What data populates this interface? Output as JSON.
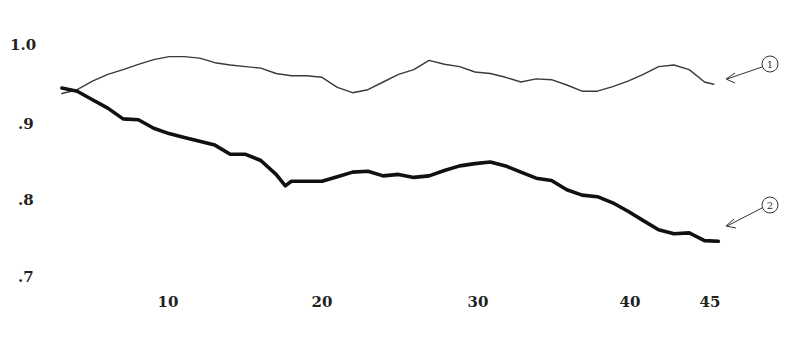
{
  "chart_data": {
    "type": "line",
    "title": "",
    "xlabel": "",
    "ylabel": "",
    "xlim": [
      0,
      50
    ],
    "ylim": [
      0.7,
      1.0
    ],
    "grid": false,
    "legend_position": "none (series identified by circled callout numbers at right)",
    "x_ticks": [
      10,
      20,
      30,
      40,
      45
    ],
    "x_tick_labels": [
      "10",
      "20",
      "30",
      "40",
      "45"
    ],
    "y_ticks": [
      1.0,
      0.9,
      0.8,
      0.7
    ],
    "y_tick_labels": [
      "1.0",
      ".9",
      ".8",
      ".7"
    ],
    "series": [
      {
        "name": "1",
        "line_weight": "thin",
        "x": [
          3,
          4,
          5,
          6,
          7,
          8,
          9,
          10,
          11,
          12,
          13,
          14,
          15,
          16,
          17,
          18,
          19,
          20,
          21,
          22,
          23,
          24,
          25,
          26,
          27,
          28,
          29,
          30,
          31,
          32,
          33,
          34,
          35,
          36,
          37,
          38,
          39,
          40,
          41,
          42,
          43,
          44,
          45,
          45.6
        ],
        "values": [
          0.937,
          0.942,
          0.953,
          0.962,
          0.968,
          0.975,
          0.981,
          0.985,
          0.985,
          0.983,
          0.977,
          0.974,
          0.972,
          0.97,
          0.963,
          0.96,
          0.96,
          0.958,
          0.945,
          0.938,
          0.942,
          0.952,
          0.962,
          0.968,
          0.98,
          0.975,
          0.972,
          0.965,
          0.963,
          0.958,
          0.952,
          0.956,
          0.955,
          0.948,
          0.94,
          0.94,
          0.946,
          0.953,
          0.962,
          0.972,
          0.974,
          0.968,
          0.952,
          0.949
        ]
      },
      {
        "name": "2",
        "line_weight": "thick",
        "x": [
          3,
          4,
          5,
          6,
          7,
          8,
          9,
          10,
          11,
          12,
          13,
          14,
          15,
          16,
          17,
          17.6,
          18,
          19,
          20,
          21,
          22,
          23,
          24,
          25,
          26,
          27,
          28,
          29,
          30,
          31,
          32,
          33,
          34,
          35,
          36,
          37,
          38,
          39,
          40,
          41,
          42,
          43,
          44,
          45,
          45.9
        ],
        "values": [
          0.944,
          0.94,
          0.929,
          0.918,
          0.904,
          0.903,
          0.892,
          0.885,
          0.88,
          0.875,
          0.87,
          0.858,
          0.858,
          0.85,
          0.832,
          0.817,
          0.823,
          0.823,
          0.823,
          0.829,
          0.835,
          0.836,
          0.83,
          0.832,
          0.828,
          0.83,
          0.837,
          0.843,
          0.846,
          0.848,
          0.843,
          0.835,
          0.827,
          0.824,
          0.812,
          0.805,
          0.803,
          0.795,
          0.784,
          0.772,
          0.76,
          0.755,
          0.756,
          0.746,
          0.745
        ]
      }
    ],
    "annotations": [
      {
        "label": "1",
        "points_to": "series 1 end"
      },
      {
        "label": "2",
        "points_to": "series 2 end"
      }
    ]
  },
  "axis": {
    "y_labels": [
      "1.0",
      ".9",
      ".8",
      ".7"
    ],
    "x_labels": [
      "10",
      "20",
      "30",
      "40",
      "45"
    ]
  },
  "callouts": [
    {
      "label": "1"
    },
    {
      "label": "2"
    }
  ],
  "colors": {
    "series_1": "#3a3a3a",
    "series_2": "#111111",
    "background": "#ffffff"
  }
}
